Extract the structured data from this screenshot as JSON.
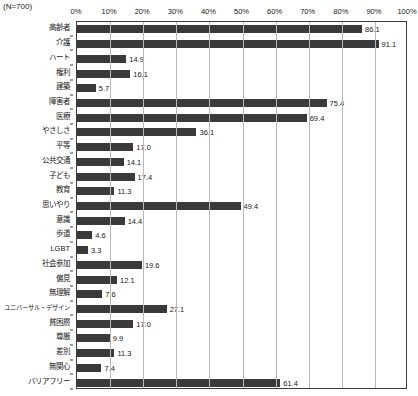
{
  "note": "(N=700)",
  "chart_data": {
    "type": "bar",
    "orientation": "horizontal",
    "title": "",
    "subtitle": "",
    "xlabel": "",
    "ylabel": "",
    "xlim": [
      0,
      100
    ],
    "xtick_labels": [
      "0%",
      "10%",
      "20%",
      "30%",
      "40%",
      "50%",
      "60%",
      "70%",
      "80%",
      "90%",
      "100%"
    ],
    "xticks": [
      0,
      10,
      20,
      30,
      40,
      50,
      60,
      70,
      80,
      90,
      100
    ],
    "grid": true,
    "legend": false,
    "bar_color": "#3a3a3a",
    "sample_size": 700,
    "categories": [
      "高齢者",
      "介護",
      "ハート",
      "権利",
      "建築",
      "障害者",
      "医療",
      "やさしさ",
      "平等",
      "公共交通",
      "子ども",
      "教育",
      "思いやり",
      "意識",
      "歩道",
      "LGBT",
      "社会参加",
      "偏見",
      "無理解",
      "ユニバーサル・デザイン",
      "貧困層",
      "尊厳",
      "差別",
      "無関心",
      "バリアフリー"
    ],
    "values": [
      86.1,
      91.1,
      14.9,
      16.1,
      5.7,
      75.4,
      69.4,
      36.1,
      17.0,
      14.1,
      17.4,
      11.3,
      49.4,
      14.4,
      4.6,
      3.3,
      19.6,
      12.1,
      7.6,
      27.1,
      17.0,
      9.9,
      11.3,
      7.4,
      61.4
    ],
    "value_labels": [
      "86.1",
      "91.1",
      "14.9",
      "16.1",
      "5.7",
      "75.4",
      "69.4",
      "36.1",
      "17.0",
      "14.1",
      "17.4",
      "11.3",
      "49.4",
      "14.4",
      "4.6",
      "3.3",
      "19.6",
      "12.1",
      "7.6",
      "27.1",
      "17.0",
      "9.9",
      "11.3",
      "7.4",
      "61.4"
    ]
  }
}
